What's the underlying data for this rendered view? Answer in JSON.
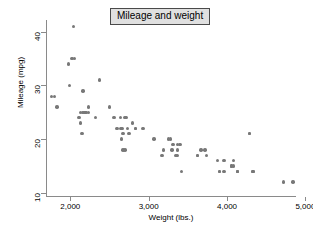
{
  "chart_data": {
    "type": "scatter",
    "title": "Mileage and weight",
    "xlabel": "Weight (lbs.)",
    "ylabel": "Mileage (mpg)",
    "xlim": [
      1690,
      4880
    ],
    "ylim": [
      9.4,
      42.2
    ],
    "xticks": [
      2000,
      3000,
      4000,
      5000
    ],
    "xticklabels": [
      "2,000",
      "3,000",
      "4,000",
      "5,000"
    ],
    "yticks": [
      10,
      20,
      30,
      40
    ],
    "yticklabels": [
      "10",
      "20",
      "30",
      "40"
    ],
    "grid": false,
    "legend": null,
    "marker_color": "#787878",
    "marker_size": 3.4,
    "axis_color": "#8a8a8a",
    "title_box_fill": "#e0e0e0",
    "title_box_border": "#4a4a4a",
    "background": "#ffffff",
    "n_points": 74,
    "series": [
      {
        "name": "Cars",
        "x": [
          2930,
          3350,
          2640,
          3250,
          4080,
          3670,
          2230,
          3280,
          3880,
          3400,
          4330,
          3900,
          4290,
          4330,
          3900,
          4290,
          3370,
          2110,
          2200,
          2150,
          2670,
          2595,
          2700,
          2556,
          2796,
          2190,
          3960,
          3310,
          3370,
          2830,
          3300,
          4080,
          3620,
          4130,
          4060,
          4130,
          4060,
          3720,
          3370,
          3070,
          3620,
          3740,
          3960,
          4130,
          2830,
          2050,
          2320,
          2160,
          1800,
          1990,
          3170,
          2710,
          2230,
          2130,
          2650,
          1760,
          2750,
          2020,
          2130,
          2040,
          3420,
          3190,
          2500,
          2660,
          2730,
          2640,
          2690,
          4720,
          4840,
          2160,
          2670,
          2370,
          1980,
          1830
        ],
        "y": [
          22,
          17,
          22,
          20,
          15,
          18,
          26,
          20,
          16,
          19,
          14,
          14,
          21,
          14,
          14,
          21,
          19,
          24,
          25,
          21,
          18,
          22,
          18,
          24,
          23,
          25,
          14,
          19,
          18,
          22,
          18,
          16,
          17,
          14,
          15,
          14,
          15,
          18,
          17,
          20,
          17,
          17,
          16,
          14,
          22,
          35,
          24,
          25,
          28,
          30,
          17,
          24,
          25,
          23,
          20,
          28,
          21,
          35,
          25,
          41,
          14,
          18,
          26,
          22,
          22,
          24,
          24,
          12,
          12,
          29,
          21,
          31,
          34,
          26
        ]
      }
    ]
  },
  "figure": {
    "title_text": "Mileage and weight",
    "x_axis_title": "Weight (lbs.)",
    "y_axis_title": "Mileage (mpg)"
  }
}
